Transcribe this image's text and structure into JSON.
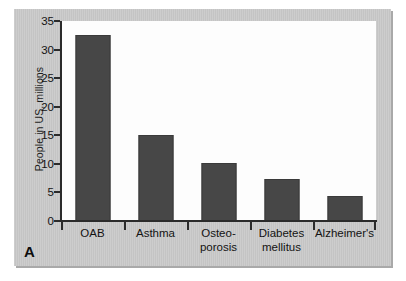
{
  "figure": {
    "panel_letter": "A",
    "panel_bg_color": "#c8c8c8",
    "plot_bg_color": "#fdfdfd",
    "bar_color": "#474747",
    "axis_color": "#2b2b2b"
  },
  "chart_data": {
    "type": "bar",
    "title": "",
    "xlabel": "",
    "ylabel": "People in US, millions",
    "ylim": [
      0,
      35
    ],
    "yticks": [
      0,
      5,
      10,
      15,
      20,
      25,
      30,
      35
    ],
    "ytick_labels": [
      "0",
      "5",
      "10",
      "15",
      "20",
      "25",
      "30",
      "35"
    ],
    "grid": false,
    "legend": false,
    "categories": [
      "OAB",
      "Asthma",
      "Osteo-porosis",
      "Diabetes mellitus",
      "Alzheimer's"
    ],
    "category_lines": [
      [
        "OAB"
      ],
      [
        "Asthma"
      ],
      [
        "Osteo-",
        "porosis"
      ],
      [
        "Diabetes",
        "mellitus"
      ],
      [
        "Alzheimer's"
      ]
    ],
    "values": [
      32.5,
      15.1,
      10.1,
      7.4,
      4.4
    ],
    "series": [
      {
        "name": "People in US, millions",
        "values": [
          32.5,
          15.1,
          10.1,
          7.4,
          4.4
        ]
      }
    ]
  }
}
